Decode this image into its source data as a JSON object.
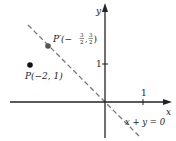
{
  "diagram": {
    "axes": {
      "x_label": "x",
      "y_label": "y",
      "x_tick_label": "1",
      "y_tick_label": "1"
    },
    "line": {
      "equation_label": "x + y = 0",
      "style": "dashed",
      "color": "#777777"
    },
    "points": [
      {
        "name": "P",
        "label": "P(−2, 1)",
        "x": -2,
        "y": 1,
        "color": "#111111"
      },
      {
        "name": "P'",
        "label_main": "P′(−",
        "frac1_num": "3",
        "frac1_den": "2",
        "frac2_num": "3",
        "frac2_den": "2",
        "x": -1.5,
        "y": 1.5,
        "color": "#555555"
      }
    ],
    "colors": {
      "axis": "#222222",
      "dashed_line": "#777777"
    }
  }
}
